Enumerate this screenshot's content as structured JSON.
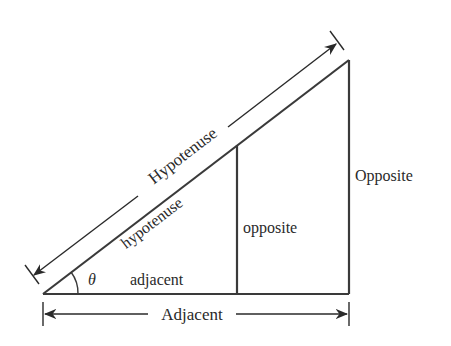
{
  "diagram": {
    "type": "similar-right-triangles",
    "colors": {
      "line": "#3a3a3a",
      "text": "#2a2a2a",
      "background": "#ffffff"
    },
    "angle_label": "θ",
    "small_triangle": {
      "hypotenuse_label": "hypotenuse",
      "adjacent_label": "adjacent",
      "opposite_label": "opposite"
    },
    "large_triangle": {
      "hypotenuse_label": "Hypotenuse",
      "adjacent_label": "Adjacent",
      "opposite_label": "Opposite"
    }
  }
}
